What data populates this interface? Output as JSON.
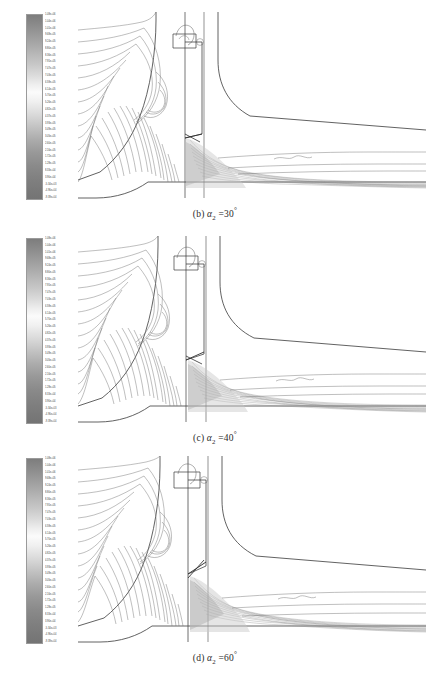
{
  "figure": {
    "type": "cfd-contour-multipanel",
    "quantity": "static pressure",
    "units": "Pa"
  },
  "colorbar": {
    "orientation": "vertical",
    "colormap": "grayscale",
    "colors": {
      "high": "#7d7d7d",
      "mid": "#fbfbfb",
      "low": "#747474"
    },
    "labels": [
      "1.08e+06",
      "1.04e+06",
      "1.01e+06",
      "9.68e+05",
      "9.24e+05",
      "8.80e+05",
      "8.36e+05",
      "7.91e+05",
      "7.47e+05",
      "7.03e+05",
      "6.59e+05",
      "6.14e+05",
      "5.70e+05",
      "5.26e+05",
      "4.82e+05",
      "4.37e+05",
      "3.93e+05",
      "3.49e+05",
      "3.05e+05",
      "2.60e+05",
      "2.16e+05",
      "1.72e+05",
      "1.28e+05",
      "8.33e+04",
      "3.90e+04",
      "-5.34e+03",
      "-4.96e+04",
      "-9.39e+04"
    ]
  },
  "panels": [
    {
      "id": "b",
      "tag": "(b)",
      "variable": "α",
      "subscript": "2",
      "equals": "=",
      "value": "30",
      "degree": "°",
      "caption": "(b) α2 = 30°",
      "blade_angle_deg": 30
    },
    {
      "id": "c",
      "tag": "(c)",
      "variable": "α",
      "subscript": "2",
      "equals": "=",
      "value": "40",
      "degree": "°",
      "caption": "(c) α2 = 40°",
      "blade_angle_deg": 40
    },
    {
      "id": "d",
      "tag": "(d)",
      "variable": "α",
      "subscript": "2",
      "equals": "=",
      "value": "60",
      "degree": "°",
      "caption": "(d) α2 = 60°",
      "blade_angle_deg": 60
    }
  ],
  "chart_data": {
    "type": "heatmap",
    "title": "",
    "xlabel": "",
    "ylabel": "",
    "legend_position": "left",
    "grid": false,
    "colorbar_range": [
      -93900,
      1080000
    ],
    "colorbar_units": "Pa",
    "n_levels": 28,
    "series": [
      {
        "name": "(b) a2 = 30 deg",
        "blade_angle_deg": 30
      },
      {
        "name": "(c) a2 = 40 deg",
        "blade_angle_deg": 40
      },
      {
        "name": "(d) a2 = 60 deg",
        "blade_angle_deg": 60
      }
    ]
  }
}
